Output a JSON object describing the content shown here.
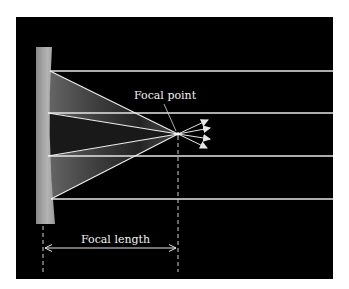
{
  "diagram": {
    "labels": {
      "focal_point": "Focal point",
      "focal_length": "Focal length"
    },
    "colors": {
      "background": "#000000",
      "page": "#ffffff",
      "ray": "#e6e6e6",
      "mirror": "#a8a8a8",
      "text": "#f2f2f2"
    },
    "mirror": {
      "shape": "concave",
      "top_y": 47,
      "bottom_y": 224
    },
    "incoming_rays_y": [
      71,
      113,
      156,
      199
    ],
    "focal_point": {
      "x": 178,
      "y": 134
    },
    "outgoing_arrow_count": 4
  }
}
